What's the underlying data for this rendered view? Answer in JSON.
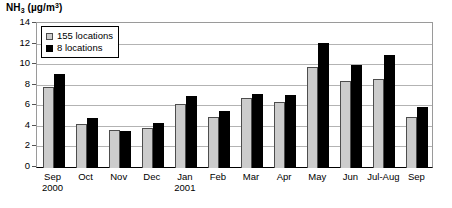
{
  "chart_data": {
    "type": "bar",
    "title_parts": {
      "species": "NH",
      "sub": "3",
      "unit_prefix": " (µg/m",
      "sup": "3",
      "unit_suffix": ")"
    },
    "xlabel": "",
    "ylabel": "NH3 (µg/m3)",
    "ylim": [
      0,
      14
    ],
    "yticks": [
      0,
      2,
      4,
      6,
      8,
      10,
      12,
      14
    ],
    "grid": true,
    "legend_position": "top-left",
    "categories": [
      "Sep",
      "Oct",
      "Nov",
      "Dec",
      "Jan",
      "Feb",
      "Mar",
      "Apr",
      "May",
      "Jun",
      "Jul-Aug",
      "Sep"
    ],
    "category_sublabels": [
      "2000",
      "",
      "",
      "",
      "2001",
      "",
      "",
      "",
      "",
      "",
      "",
      ""
    ],
    "series": [
      {
        "name": "155 locations",
        "color": "#cccccc",
        "values": [
          7.9,
          4.3,
          3.7,
          3.9,
          6.2,
          5.0,
          6.8,
          6.4,
          9.8,
          8.5,
          8.7,
          5.0
        ]
      },
      {
        "name": "8 locations",
        "color": "#000000",
        "values": [
          9.1,
          4.85,
          3.6,
          4.4,
          7.0,
          5.5,
          7.2,
          7.1,
          12.2,
          10.0,
          11.0,
          5.9
        ]
      }
    ]
  },
  "legend": {
    "entries": [
      {
        "label": "155 locations",
        "swatch": "light"
      },
      {
        "label": "8 locations",
        "swatch": "dark"
      }
    ]
  }
}
